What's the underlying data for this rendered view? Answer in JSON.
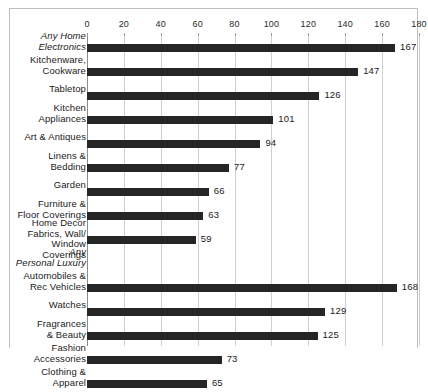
{
  "chart_data": {
    "type": "bar",
    "orientation": "horizontal",
    "title": "",
    "xlabel": "",
    "ylabel": "",
    "xlim": [
      0,
      180
    ],
    "xticks": [
      0,
      20,
      40,
      60,
      80,
      100,
      120,
      140,
      160,
      180
    ],
    "grid": "vertical",
    "axis_position": "top",
    "legend": "none",
    "bar_color": "#262626",
    "gridline_color": "#cfcfcf",
    "clipped_bottom": true,
    "rows": [
      {
        "label": "Any Home\nElectronics",
        "lines": 2,
        "group_header": true,
        "value": 167
      },
      {
        "label": "Kitchenware,\nCookware",
        "lines": 2,
        "group_header": false,
        "value": 147
      },
      {
        "label": "Tabletop",
        "lines": 1,
        "group_header": false,
        "value": 126
      },
      {
        "label": "Kitchen\nAppliances",
        "lines": 2,
        "group_header": false,
        "value": 101
      },
      {
        "label": "Art & Antiques",
        "lines": 1,
        "group_header": false,
        "value": 94
      },
      {
        "label": "Linens &\nBedding",
        "lines": 2,
        "group_header": false,
        "value": 77
      },
      {
        "label": "Garden",
        "lines": 1,
        "group_header": false,
        "value": 66
      },
      {
        "label": "Furniture &\nFloor Coverings",
        "lines": 2,
        "group_header": false,
        "value": 63
      },
      {
        "label": "Home Decor\nFabrics, Wall/\nWindow Coverings",
        "lines": 3,
        "group_header": false,
        "value": 59
      },
      {
        "label": "Any\nPersonal Luxury",
        "lines": 2,
        "group_header": true,
        "value": null
      },
      {
        "label": "Automobiles &\nRec Vehicles",
        "lines": 2,
        "group_header": false,
        "value": 168
      },
      {
        "label": "Watches",
        "lines": 1,
        "group_header": false,
        "value": 129
      },
      {
        "label": "Fragrances\n& Beauty",
        "lines": 2,
        "group_header": false,
        "value": 125
      },
      {
        "label": "Fashion\nAccessories",
        "lines": 2,
        "group_header": false,
        "value": 73
      },
      {
        "label": "Clothing &\nApparel",
        "lines": 2,
        "group_header": false,
        "value": 65
      }
    ]
  }
}
